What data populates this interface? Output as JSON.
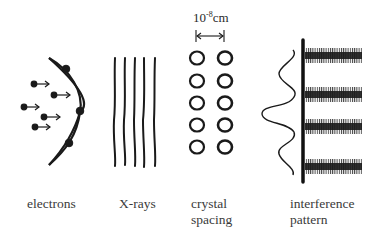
{
  "diagram": {
    "panels": [
      {
        "id": "electrons",
        "label_lines": [
          "electrons"
        ]
      },
      {
        "id": "x-rays",
        "label_lines": [
          "X-rays"
        ]
      },
      {
        "id": "crystal",
        "label_lines": [
          "crystal",
          "spacing"
        ]
      },
      {
        "id": "interference",
        "label_lines": [
          "interference",
          "pattern"
        ]
      }
    ],
    "scale_bar": {
      "base": "10",
      "exponent": "-8",
      "unit": "cm"
    },
    "colors": {
      "ink": "#1a1a1a",
      "text": "#3a3a3a",
      "background": "#ffffff"
    }
  }
}
